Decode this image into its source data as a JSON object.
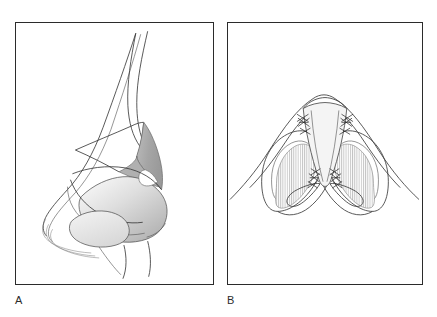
{
  "figure": {
    "kind": "medical-illustration",
    "background_color": "#ffffff",
    "line_color": "#3a3a3a",
    "panel_border_color": "#2b2b2b"
  },
  "panels": [
    {
      "id": "A",
      "caption": "A",
      "view": "lateral profile view of the nose",
      "shading": {
        "dark_gray": "#a8a8a8",
        "mid_gray": "#c9c9c9",
        "light_gray": "#e2e2e2",
        "pale_gray": "#f0f0f0"
      }
    },
    {
      "id": "B",
      "caption": "B",
      "view": "basal (worm's-eye) view of the nose",
      "shading": {
        "hatch_stroke": "#b4b4b4",
        "strut_fill": "#f3f3f3",
        "hatch_spacing_px": 2.2
      },
      "suture_groups": [
        {
          "name": "upper-lateral-suture-left",
          "marks": 3
        },
        {
          "name": "upper-lateral-suture-right",
          "marks": 3
        },
        {
          "name": "domal-suture-left",
          "marks": 3
        },
        {
          "name": "domal-suture-right",
          "marks": 3
        }
      ]
    }
  ]
}
